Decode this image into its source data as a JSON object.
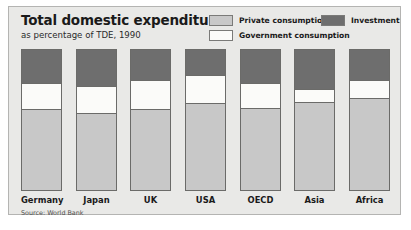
{
  "header": {
    "title": "Total domestic expenditure",
    "subtitle": "as percentage of TDE, 1990"
  },
  "legend": {
    "items": [
      {
        "label": "Private consumption",
        "color": "#c8c8c8",
        "key": "private"
      },
      {
        "label": "Investment",
        "color": "#6e6e6e",
        "key": "investment"
      },
      {
        "label": "Government consumption",
        "color": "#fbfbf9",
        "key": "government"
      }
    ]
  },
  "footer": {
    "source": "Source: World Bank"
  },
  "colors": {
    "panel_background": "#e9e9e7",
    "panel_border": "#b4b4b2",
    "bar_outline": "#6b6b69",
    "private": "#c8c8c8",
    "investment": "#6e6e6e",
    "government": "#fbfbf9",
    "text": "#1a1a1a"
  },
  "chart_data": {
    "type": "bar",
    "title": "Total domestic expenditure",
    "subtitle": "as percentage of TDE, 1990",
    "xlabel": "",
    "ylabel": "",
    "ylim": [
      0,
      100
    ],
    "grid": false,
    "stacked": true,
    "stack_order_bottom_to_top": [
      "Private consumption",
      "Government consumption",
      "Investment"
    ],
    "legend_position": "top-right",
    "units": "percent of TDE",
    "categories": [
      "Germany",
      "Japan",
      "UK",
      "USA",
      "OECD",
      "Asia",
      "Africa"
    ],
    "series": [
      {
        "name": "Private consumption",
        "color": "#c8c8c8",
        "values": [
          58,
          55,
          58,
          62,
          59,
          63,
          66
        ]
      },
      {
        "name": "Government consumption",
        "color": "#fbfbf9",
        "values": [
          18,
          19,
          20,
          20,
          17,
          9,
          12
        ]
      },
      {
        "name": "Investment",
        "color": "#6e6e6e",
        "values": [
          24,
          26,
          22,
          18,
          24,
          28,
          22
        ]
      }
    ],
    "source": "Source: World Bank"
  }
}
